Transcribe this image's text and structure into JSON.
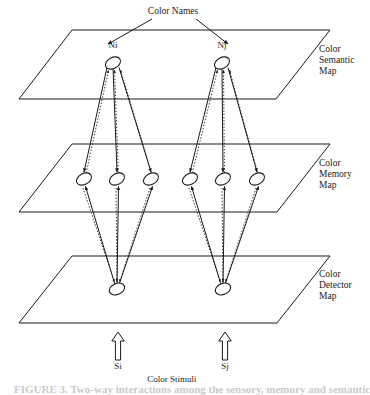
{
  "figure": {
    "title_label": "Color Names",
    "stimuli_label": "Color Stimuli",
    "caption_partial": "FIGURE 3.  Two-way interactions among the sensory, memory and semantic color",
    "ink_color": "#1a1a1a",
    "background_color": "#ffffff"
  },
  "planes": [
    {
      "id": "semantic",
      "label_line1": "Color",
      "label_line2": "Semantic",
      "label_line3": "Map",
      "top_y": 30,
      "bottom_y": 99,
      "top_left_x": 72,
      "top_right_x": 330,
      "bottom_left_x": 19,
      "bottom_right_x": 276,
      "label_x": 319,
      "label_y": 52
    },
    {
      "id": "memory",
      "label_line1": "Color",
      "label_line2": "Memory",
      "label_line3": "Map",
      "top_y": 144,
      "bottom_y": 212,
      "top_left_x": 72,
      "top_right_x": 330,
      "bottom_left_x": 19,
      "bottom_right_x": 277,
      "label_x": 319,
      "label_y": 166
    },
    {
      "id": "detector",
      "label_line1": "Color",
      "label_line2": "Detector",
      "label_line3": "Map",
      "top_y": 256,
      "bottom_y": 323,
      "top_left_x": 72,
      "top_right_x": 330,
      "bottom_left_x": 19,
      "bottom_right_x": 277,
      "label_x": 319,
      "label_y": 277
    }
  ],
  "semantic_nodes": [
    {
      "id": "Ni",
      "label": "Ni",
      "x": 113,
      "y": 63,
      "label_x": 113,
      "label_y": 48
    },
    {
      "id": "Nj",
      "label": "Nj",
      "x": 222,
      "y": 63,
      "label_x": 222,
      "label_y": 48
    }
  ],
  "memory_nodes": [
    {
      "id": "m1",
      "x": 84,
      "y": 179
    },
    {
      "id": "m2",
      "x": 117,
      "y": 179
    },
    {
      "id": "m3",
      "x": 151,
      "y": 179
    },
    {
      "id": "m4",
      "x": 190,
      "y": 179
    },
    {
      "id": "m5",
      "x": 223,
      "y": 179
    },
    {
      "id": "m6",
      "x": 257,
      "y": 179
    }
  ],
  "detector_nodes": [
    {
      "id": "d1",
      "x": 117,
      "y": 289
    },
    {
      "id": "d2",
      "x": 223,
      "y": 289
    }
  ],
  "stimuli": [
    {
      "id": "Si",
      "label": "Si",
      "x": 118,
      "y_top": 332,
      "y_bottom": 360,
      "label_x": 118,
      "label_y": 369
    },
    {
      "id": "Sj",
      "label": "Sj",
      "x": 225,
      "y_top": 332,
      "y_bottom": 360,
      "label_x": 225,
      "label_y": 369
    }
  ],
  "title_anchor": {
    "x": 173,
    "y": 14
  },
  "stimuli_label_pos": {
    "x": 172,
    "y": 382
  },
  "name_arrows": [
    {
      "from_x": 152,
      "from_y": 19,
      "to_x": 108,
      "to_y": 44
    },
    {
      "from_x": 196,
      "from_y": 19,
      "to_x": 228,
      "to_y": 44
    }
  ],
  "legend": {
    "solid_link_meaning": "feedforward / bottom-up connection (solid line with arrowhead)",
    "dotted_link_meaning": "feedback / top-down connection (dotted line with arrowhead)"
  }
}
